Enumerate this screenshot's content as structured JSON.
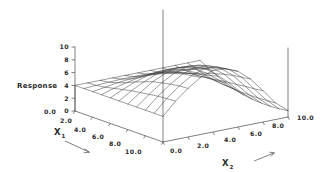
{
  "figure": {
    "title": "",
    "background_color": "#ffffff",
    "line_color": "#3a3a3a",
    "text_color": "#2b2b2b"
  },
  "axes": {
    "response": {
      "label": "Response",
      "ticks": [
        "10",
        "8",
        "6",
        "4",
        "2",
        "0"
      ],
      "range": [
        0,
        10
      ]
    },
    "x1": {
      "label": "X",
      "subscript": "1",
      "ticks": [
        "0.0",
        "2.0",
        "4.0",
        "6.0",
        "8.0",
        "10.0"
      ],
      "range": [
        0,
        10
      ],
      "arrow": "direction-arrow"
    },
    "x2": {
      "label": "X",
      "subscript": "2",
      "ticks": [
        "0.0",
        "2.0",
        "4.0",
        "6.0",
        "8.0",
        "10.0"
      ],
      "range": [
        0,
        10
      ],
      "arrow": "direction-arrow"
    }
  },
  "chart_data": {
    "type": "surface",
    "title": "",
    "xlabel": "X1",
    "ylabel": "X2",
    "zlabel": "Response",
    "xlim": [
      0,
      10
    ],
    "ylim": [
      0,
      10
    ],
    "zlim": [
      0,
      10
    ],
    "grid": false,
    "legend": "none",
    "mesh_n_x1": 11,
    "mesh_n_x2": 11,
    "x1_values": [
      0,
      1,
      2,
      3,
      4,
      5,
      6,
      7,
      8,
      9,
      10
    ],
    "x2_values": [
      0,
      1,
      2,
      3,
      4,
      5,
      6,
      7,
      8,
      9,
      10
    ],
    "z_matrix": [
      [
        4.0,
        4.0,
        4.0,
        4.0,
        4.0,
        4.0,
        4.0,
        4.0,
        4.0,
        4.0,
        4.0
      ],
      [
        4.0,
        4.1,
        4.2,
        4.3,
        4.3,
        4.3,
        4.2,
        4.0,
        3.8,
        3.5,
        3.2
      ],
      [
        4.0,
        4.3,
        4.6,
        4.8,
        4.9,
        4.8,
        4.6,
        4.2,
        3.7,
        3.1,
        2.5
      ],
      [
        4.0,
        4.6,
        5.1,
        5.5,
        5.7,
        5.6,
        5.2,
        4.6,
        3.7,
        2.8,
        1.9
      ],
      [
        4.0,
        4.9,
        5.7,
        6.3,
        6.6,
        6.5,
        6.0,
        5.1,
        3.9,
        2.6,
        1.4
      ],
      [
        4.0,
        5.2,
        6.2,
        7.0,
        7.4,
        7.3,
        6.7,
        5.6,
        4.1,
        2.5,
        1.0
      ],
      [
        4.0,
        5.4,
        6.7,
        7.6,
        8.1,
        8.0,
        7.3,
        6.0,
        4.3,
        2.4,
        0.8
      ],
      [
        4.0,
        5.6,
        7.0,
        8.1,
        8.7,
        8.6,
        7.8,
        6.4,
        4.4,
        2.4,
        0.7
      ],
      [
        4.0,
        5.8,
        7.3,
        8.5,
        9.1,
        9.0,
        8.2,
        6.7,
        4.6,
        2.4,
        0.7
      ],
      [
        4.0,
        5.9,
        7.5,
        8.7,
        9.4,
        9.3,
        8.5,
        6.9,
        4.7,
        2.5,
        0.8
      ],
      [
        4.0,
        6.0,
        7.6,
        8.9,
        9.6,
        9.5,
        8.7,
        7.1,
        4.9,
        2.6,
        1.0
      ]
    ]
  }
}
